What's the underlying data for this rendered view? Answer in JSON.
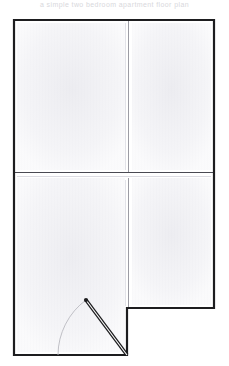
{
  "document": {
    "title": "Floor Plan",
    "header_caption": "a simple two bedroom apartment floor plan"
  },
  "canvas": {
    "width": 229,
    "height": 366,
    "background_color": "#ffffff"
  },
  "style": {
    "wall_color": "#1d1d1f",
    "thin_wall_color": "#9a9aa0",
    "room_fill_color": "#f4f4f6",
    "hatch_color": "#e6e6ea",
    "door_leaf_color": "#1d1d1f",
    "door_arc_color": "#b4b4ba",
    "wall_thickness_outer": 2.4,
    "wall_thickness_inner": 1.0
  },
  "outline": {
    "name": "apartment-outline",
    "points": "14,20 214,20 214,308 127,308 127,355 14,355",
    "description": "L-shaped apartment perimeter with notch at bottom right"
  },
  "walls": [
    {
      "name": "exterior-wall-top",
      "x1": 14,
      "y1": 20,
      "x2": 214,
      "y2": 20,
      "kind": "exterior"
    },
    {
      "name": "exterior-wall-right",
      "x1": 214,
      "y1": 20,
      "x2": 214,
      "y2": 308,
      "kind": "exterior"
    },
    {
      "name": "exterior-wall-notch-bottom",
      "x1": 214,
      "y1": 308,
      "x2": 127,
      "y2": 308,
      "kind": "exterior"
    },
    {
      "name": "exterior-wall-notch-side",
      "x1": 127,
      "y1": 308,
      "x2": 127,
      "y2": 355,
      "kind": "exterior"
    },
    {
      "name": "exterior-wall-bottom",
      "x1": 127,
      "y1": 355,
      "x2": 14,
      "y2": 355,
      "kind": "exterior"
    },
    {
      "name": "exterior-wall-left",
      "x1": 14,
      "y1": 355,
      "x2": 14,
      "y2": 20,
      "kind": "exterior"
    },
    {
      "name": "interior-wall-horizontal",
      "x1": 14,
      "y1": 173,
      "x2": 214,
      "y2": 173,
      "kind": "interior"
    },
    {
      "name": "interior-wall-vertical-upper",
      "x1": 128,
      "y1": 20,
      "x2": 128,
      "y2": 173,
      "kind": "interior"
    },
    {
      "name": "interior-wall-vertical-lower",
      "x1": 128,
      "y1": 178,
      "x2": 128,
      "y2": 308,
      "kind": "interior"
    }
  ],
  "rooms": [
    {
      "name": "room-top-left",
      "x": 17,
      "y": 23,
      "width": 108,
      "height": 147,
      "label": ""
    },
    {
      "name": "room-top-right",
      "x": 132,
      "y": 23,
      "width": 79,
      "height": 147,
      "label": ""
    },
    {
      "name": "room-bottom-left",
      "x": 17,
      "y": 178,
      "width": 108,
      "height": 174,
      "label": ""
    },
    {
      "name": "room-bottom-right",
      "x": 132,
      "y": 178,
      "width": 79,
      "height": 127,
      "label": ""
    }
  ],
  "door": {
    "name": "entry-door",
    "hinge_x": 127,
    "hinge_y": 355,
    "leaf_end_x": 86,
    "leaf_end_y": 300,
    "arc_end_x": 58,
    "arc_end_y": 355,
    "radius": 69,
    "swing": "counter-clockwise"
  }
}
